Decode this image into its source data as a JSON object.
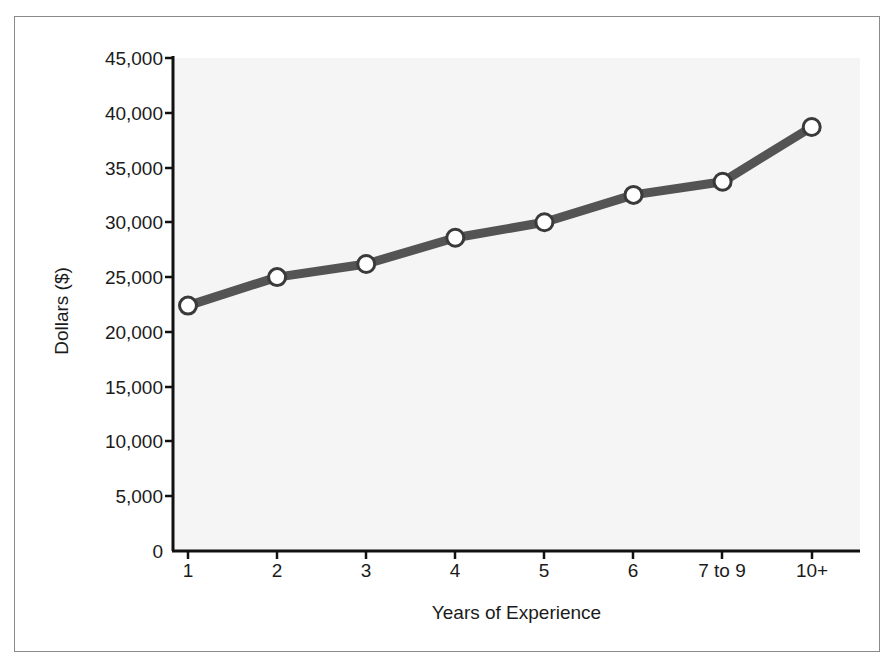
{
  "chart_data": {
    "type": "line",
    "title": "",
    "xlabel": "Years of Experience",
    "ylabel": "Dollars ($)",
    "categories": [
      "1",
      "2",
      "3",
      "4",
      "5",
      "6",
      "7 to 9",
      "10+"
    ],
    "values": [
      22400,
      25000,
      26200,
      28600,
      30000,
      32500,
      33700,
      38700
    ],
    "series": [
      {
        "name": "Salary",
        "values": [
          22400,
          25000,
          26200,
          28600,
          30000,
          32500,
          33700,
          38700
        ]
      }
    ],
    "ylim": [
      0,
      45000
    ],
    "ytick_labels": [
      "0",
      "5,000",
      "10,000",
      "15,000",
      "20,000",
      "25,000",
      "30,000",
      "35,000",
      "40,000",
      "45,000"
    ],
    "ytick_values": [
      0,
      5000,
      10000,
      15000,
      20000,
      25000,
      30000,
      35000,
      40000,
      45000
    ],
    "xtick_labels": [
      "1",
      "2",
      "3",
      "4",
      "5",
      "6",
      "7 to 9",
      "10+"
    ],
    "grid": false,
    "legend": "none",
    "colors": {
      "line": "#545454",
      "marker_fill": "#ffffff",
      "marker_stroke": "#3a3a3a",
      "axis": "#111111",
      "plot_background": "#f5f5f5",
      "frame_border": "#8a8a8a",
      "text": "#1b1b1b"
    }
  }
}
